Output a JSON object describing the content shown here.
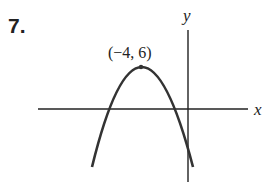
{
  "problem": {
    "number": "7."
  },
  "axes": {
    "x_label": "x",
    "y_label": "y"
  },
  "vertex": {
    "label": "(−4, 6)",
    "x": -4,
    "y": 6
  },
  "curve": {
    "type": "downward-opening parabola",
    "color": "#333333"
  }
}
